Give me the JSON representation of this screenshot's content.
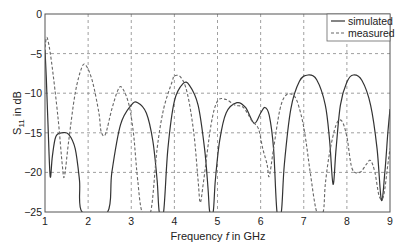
{
  "chart_data": {
    "type": "line",
    "title": "",
    "xlabel": "Frequency f in GHz",
    "xlabel_parts": {
      "prefix": "Frequency ",
      "var": "f",
      "suffix": " in GHz"
    },
    "ylabel": "S11 in dB",
    "ylabel_parts": {
      "main": "S",
      "sub": "11",
      "suffix": " in dB"
    },
    "xlim": [
      1,
      9
    ],
    "ylim": [
      -25,
      0
    ],
    "xticks": [
      1,
      2,
      3,
      4,
      5,
      6,
      7,
      8,
      9
    ],
    "yticks": [
      0,
      -5,
      -10,
      -15,
      -20,
      -25
    ],
    "xtick_labels": [
      "1",
      "2",
      "3",
      "4",
      "5",
      "6",
      "7",
      "8",
      "9"
    ],
    "ytick_labels": [
      "0",
      "−5",
      "−10",
      "−15",
      "−20",
      "−25"
    ],
    "grid": true,
    "legend_position": "upper right",
    "series": [
      {
        "name": "simulated",
        "style": "solid",
        "color": "#333333",
        "points": [
          [
            1.0,
            -4.5
          ],
          [
            1.03,
            -8
          ],
          [
            1.07,
            -14
          ],
          [
            1.12,
            -20.5
          ],
          [
            1.17,
            -18
          ],
          [
            1.25,
            -15.5
          ],
          [
            1.4,
            -15
          ],
          [
            1.55,
            -15.2
          ],
          [
            1.7,
            -17
          ],
          [
            1.8,
            -21
          ],
          [
            1.86,
            -25
          ],
          [
            2.45,
            -25
          ],
          [
            2.55,
            -20
          ],
          [
            2.75,
            -14
          ],
          [
            3.0,
            -11.5
          ],
          [
            3.15,
            -11.2
          ],
          [
            3.35,
            -12.5
          ],
          [
            3.5,
            -16
          ],
          [
            3.6,
            -21
          ],
          [
            3.65,
            -25
          ],
          [
            3.75,
            -25
          ],
          [
            3.85,
            -17
          ],
          [
            4.0,
            -11
          ],
          [
            4.2,
            -8.8
          ],
          [
            4.35,
            -9
          ],
          [
            4.55,
            -11.5
          ],
          [
            4.7,
            -17
          ],
          [
            4.78,
            -22
          ],
          [
            4.82,
            -25
          ],
          [
            4.9,
            -25
          ],
          [
            4.95,
            -21
          ],
          [
            5.05,
            -16
          ],
          [
            5.2,
            -12.5
          ],
          [
            5.45,
            -11.2
          ],
          [
            5.65,
            -11.8
          ],
          [
            5.85,
            -13.8
          ],
          [
            6.0,
            -12.5
          ],
          [
            6.1,
            -11.8
          ],
          [
            6.2,
            -12.8
          ],
          [
            6.3,
            -17
          ],
          [
            6.38,
            -25
          ],
          [
            6.48,
            -25
          ],
          [
            6.55,
            -19
          ],
          [
            6.7,
            -12
          ],
          [
            6.9,
            -8.5
          ],
          [
            7.1,
            -7.7
          ],
          [
            7.3,
            -8.3
          ],
          [
            7.5,
            -11.5
          ],
          [
            7.6,
            -16
          ],
          [
            7.68,
            -21.5
          ],
          [
            7.75,
            -17
          ],
          [
            7.85,
            -11.5
          ],
          [
            8.0,
            -8.6
          ],
          [
            8.15,
            -7.7
          ],
          [
            8.35,
            -8.4
          ],
          [
            8.55,
            -11.5
          ],
          [
            8.7,
            -17
          ],
          [
            8.8,
            -23.5
          ],
          [
            8.88,
            -20
          ],
          [
            8.95,
            -15
          ],
          [
            9.0,
            -12
          ]
        ]
      },
      {
        "name": "measured",
        "style": "dashed",
        "color": "#666666",
        "points": [
          [
            1.0,
            -4.2
          ],
          [
            1.05,
            -3.0
          ],
          [
            1.15,
            -6
          ],
          [
            1.3,
            -13
          ],
          [
            1.4,
            -19
          ],
          [
            1.45,
            -20.5
          ],
          [
            1.55,
            -16
          ],
          [
            1.7,
            -10
          ],
          [
            1.85,
            -6.8
          ],
          [
            1.95,
            -6.5
          ],
          [
            2.1,
            -8.5
          ],
          [
            2.25,
            -12.5
          ],
          [
            2.3,
            -14.8
          ],
          [
            2.4,
            -15.2
          ],
          [
            2.55,
            -12
          ],
          [
            2.7,
            -9.5
          ],
          [
            2.8,
            -9.4
          ],
          [
            2.95,
            -11.5
          ],
          [
            3.05,
            -15
          ],
          [
            3.1,
            -18
          ],
          [
            3.15,
            -21
          ],
          [
            3.25,
            -25
          ],
          [
            3.45,
            -25
          ],
          [
            3.6,
            -17
          ],
          [
            3.75,
            -12
          ],
          [
            3.95,
            -8.5
          ],
          [
            4.0,
            -7.8
          ],
          [
            4.15,
            -8.0
          ],
          [
            4.3,
            -10
          ],
          [
            4.45,
            -15
          ],
          [
            4.55,
            -21
          ],
          [
            4.6,
            -23.8
          ],
          [
            4.68,
            -21
          ],
          [
            4.85,
            -14
          ],
          [
            5.0,
            -11
          ],
          [
            5.2,
            -10.8
          ],
          [
            5.4,
            -11.5
          ],
          [
            5.6,
            -11.8
          ],
          [
            5.8,
            -13.5
          ],
          [
            5.95,
            -14.5
          ],
          [
            6.05,
            -17
          ],
          [
            6.15,
            -19
          ],
          [
            6.2,
            -20.5
          ],
          [
            6.3,
            -17
          ],
          [
            6.45,
            -12
          ],
          [
            6.6,
            -10.2
          ],
          [
            6.8,
            -10.5
          ],
          [
            6.95,
            -13
          ],
          [
            7.05,
            -16
          ],
          [
            7.15,
            -20
          ],
          [
            7.3,
            -25
          ],
          [
            7.45,
            -25
          ],
          [
            7.5,
            -21.5
          ],
          [
            7.6,
            -17.5
          ],
          [
            7.75,
            -14
          ],
          [
            7.88,
            -13.5
          ],
          [
            8.0,
            -15.5
          ],
          [
            8.12,
            -19.5
          ],
          [
            8.3,
            -20
          ],
          [
            8.45,
            -19
          ],
          [
            8.55,
            -18.5
          ],
          [
            8.65,
            -20
          ],
          [
            8.75,
            -23
          ],
          [
            8.85,
            -23
          ],
          [
            8.95,
            -19
          ],
          [
            9.0,
            -17
          ]
        ]
      }
    ]
  }
}
